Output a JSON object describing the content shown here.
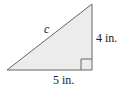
{
  "diagram": {
    "type": "right-triangle",
    "fill_color": "#ececec",
    "stroke_color": "#555555",
    "labels": {
      "hypotenuse": "c",
      "vertical_leg": "4 in.",
      "horizontal_leg": "5 in."
    },
    "right_angle_marker": true
  }
}
